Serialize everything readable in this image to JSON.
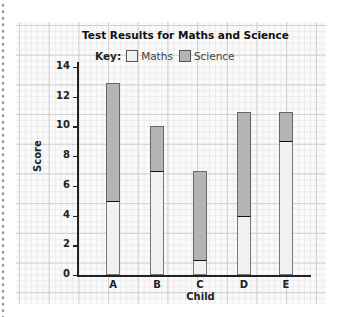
{
  "chart_data": {
    "type": "bar",
    "stacked": true,
    "title": "Test Results for Maths and Science",
    "legend_label": "Key:",
    "xlabel": "Child",
    "ylabel": "Score",
    "categories": [
      "A",
      "B",
      "C",
      "D",
      "E"
    ],
    "series": [
      {
        "name": "Maths",
        "color": "#f1f1f1",
        "values": [
          5,
          7,
          1,
          4,
          9
        ]
      },
      {
        "name": "Science",
        "color": "#b4b4b4",
        "values": [
          7.9,
          3,
          6,
          7,
          2
        ]
      }
    ],
    "totals": [
      12.9,
      10,
      7,
      11,
      11
    ],
    "yticks": [
      0,
      2,
      4,
      6,
      8,
      10,
      12,
      14
    ],
    "ylim": [
      0,
      14
    ],
    "grid": true,
    "legend_position": "top"
  }
}
